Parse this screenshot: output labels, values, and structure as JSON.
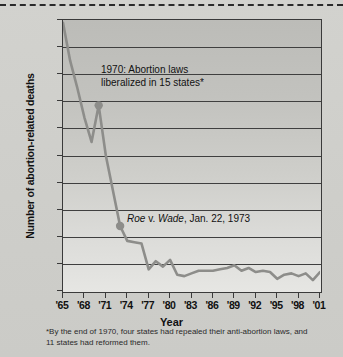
{
  "chart_data": {
    "type": "line",
    "title": "",
    "xlabel": "Year",
    "ylabel": "Number of abortion-related deaths",
    "xlim": [
      1965,
      2001
    ],
    "ylim": [
      0,
      200
    ],
    "ytick_step": 20,
    "grid": true,
    "legend": null,
    "ytick_labels": [
      "200",
      "180",
      "160",
      "140",
      "120",
      "100",
      "80",
      "60",
      "40",
      "20",
      "0"
    ],
    "ytick_values": [
      200,
      180,
      160,
      140,
      120,
      100,
      80,
      60,
      40,
      20,
      0
    ],
    "xtick_labels": [
      "'65",
      "'68",
      "'71",
      "'74",
      "'77",
      "'80",
      "'83",
      "'86",
      "'89",
      "'92",
      "'95",
      "'98",
      "'01"
    ],
    "xtick_values": [
      1965,
      1968,
      1971,
      1974,
      1977,
      1980,
      1983,
      1986,
      1989,
      1992,
      1995,
      1998,
      2001
    ],
    "x": [
      1965,
      1966,
      1967,
      1968,
      1969,
      1970,
      1971,
      1972,
      1973,
      1974,
      1975,
      1976,
      1977,
      1978,
      1979,
      1980,
      1981,
      1982,
      1983,
      1984,
      1985,
      1986,
      1987,
      1988,
      1989,
      1990,
      1991,
      1992,
      1993,
      1994,
      1995,
      1996,
      1997,
      1998,
      1999,
      2000,
      2001
    ],
    "values": [
      198,
      170,
      150,
      128,
      110,
      137,
      100,
      74,
      48,
      37,
      36,
      35,
      16,
      22,
      18,
      23,
      12,
      11,
      13,
      15,
      15,
      15,
      16,
      17,
      19,
      15,
      17,
      14,
      15,
      14,
      9,
      12,
      13,
      11,
      13,
      8,
      14
    ],
    "series": [
      {
        "name": "Abortion-related deaths",
        "color": "#8d8d8a",
        "values": [
          198,
          170,
          150,
          128,
          110,
          137,
          100,
          74,
          48,
          37,
          36,
          35,
          16,
          22,
          18,
          23,
          12,
          11,
          13,
          15,
          15,
          15,
          16,
          17,
          19,
          15,
          17,
          14,
          15,
          14,
          9,
          12,
          13,
          11,
          13,
          8,
          14
        ]
      }
    ],
    "markers": [
      {
        "name": "marker-1970",
        "x": 1970,
        "y": 137,
        "color": "#8d8d8a"
      },
      {
        "name": "marker-roe-1973",
        "x": 1973,
        "y": 48,
        "color": "#8d8d8a"
      }
    ],
    "annotations": [
      {
        "name": "annotation-1970",
        "line1": "1970: Abortion laws",
        "line2": "liberalized in 15 states*"
      },
      {
        "name": "annotation-roe",
        "prefix_italic": "Roe",
        "mid": " v. ",
        "italic2": "Wade",
        "suffix": ", Jan. 22, 1973"
      }
    ],
    "footnote": "*By the end of 1970, four states had repealed their anti-abortion laws, and 11 states had reformed them.",
    "colors": {
      "line": "#8d8d8a",
      "frame": "#3a3a3a",
      "grid": "#3f3f3f",
      "page_background": "#cfcfcb",
      "text": "#111111"
    }
  }
}
